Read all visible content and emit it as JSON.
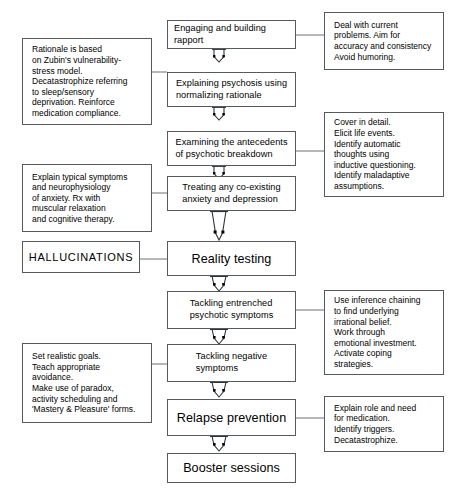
{
  "diagram": {
    "bg_color": "#ffffff",
    "stroke_color": "#555a5e",
    "text_color": "#000000"
  },
  "main_steps": [
    {
      "id": "engaging",
      "label": "Engaging and building rapport",
      "size": "small"
    },
    {
      "id": "explaining",
      "label": "Explaining psychosis using\nnormalizing rationale",
      "size": "small"
    },
    {
      "id": "examining",
      "label": "Examining the antecedents\nof psychotic breakdown",
      "size": "small"
    },
    {
      "id": "treating",
      "label": "Treating any co-existing\nanxiety and depression",
      "size": "small"
    },
    {
      "id": "reality-testing",
      "label": "Reality testing",
      "size": "big"
    },
    {
      "id": "entrenched",
      "label": "Tackling entrenched\npsychotic symptoms",
      "size": "small"
    },
    {
      "id": "negative",
      "label": "Tackling negative\nsymptoms",
      "size": "small"
    },
    {
      "id": "relapse",
      "label": "Relapse prevention",
      "size": "big"
    },
    {
      "id": "booster",
      "label": "Booster sessions",
      "size": "big"
    }
  ],
  "left_notes": [
    {
      "id": "rationale-note",
      "label": "Rationale is based\non Zubin's vulnerability-\nstress model.\nDecatastrophize referring\nto sleep/sensory\ndeprivation.  Reinforce\nmedication compliance."
    },
    {
      "id": "anxiety-note",
      "label": "Explain typical symptoms\nand neurophysiology\nof anxiety. Rx with\nmuscular relaxation\nand cognitive therapy."
    },
    {
      "id": "hallucinations-note",
      "label": "HALLUCINATIONS"
    },
    {
      "id": "goals-note",
      "label": "Set realistic goals.\nTeach appropriate\navoidance.\nMake use of paradox,\nactivity scheduling and\n'Mastery & Pleasure' forms."
    }
  ],
  "right_notes": [
    {
      "id": "current-problems-note",
      "label": "Deal with current\nproblems. Aim for\naccuracy and consistency\nAvoid humoring."
    },
    {
      "id": "cover-detail-note",
      "label": "Cover in detail.\nElicit life events.\nIdentify automatic\nthoughts using\ninductive questioning.\nIdentify maladaptive\nassumptions."
    },
    {
      "id": "inference-note",
      "label": "Use inference chaining\nto find underlying\nirrational belief.\nWork through\nemotional investment.\nActivate coping\nstrategies."
    },
    {
      "id": "medication-note",
      "label": "Explain role and need\nfor medication.\nIdentify triggers.\nDecatastrophize."
    }
  ]
}
